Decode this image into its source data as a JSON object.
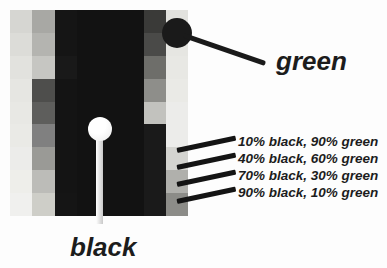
{
  "figure": {
    "name": "pixelated-green-black-gradient-diagram",
    "background_color": "#fdfdfd"
  },
  "image_block": {
    "name": "pixelated-image",
    "columns": 8,
    "rows": 9,
    "description": "Blocky pixelated grayscale image of black-to-green gradient squares",
    "grid_values": [
      [
        "#d6d6d2",
        "#a8a8a4",
        "#151515",
        "#121212",
        "#121212",
        "#121212",
        "#3a3a38",
        "#e2e2de"
      ],
      [
        "#dcdcd8",
        "#b4b4b0",
        "#151515",
        "#121212",
        "#121212",
        "#121212",
        "#4a4a48",
        "#e6e6e2"
      ],
      [
        "#e2e2de",
        "#c6c6c2",
        "#191919",
        "#121212",
        "#121212",
        "#121212",
        "#6e6e6a",
        "#e8e8e4"
      ],
      [
        "#e6e6e2",
        "#4e4e4c",
        "#141414",
        "#121212",
        "#121212",
        "#121212",
        "#8e8e8a",
        "#eaeae6"
      ],
      [
        "#e8e8e4",
        "#5e5e5c",
        "#141414",
        "#121212",
        "#121212",
        "#121212",
        "#c2c2be",
        "#ececea"
      ],
      [
        "#eaeae6",
        "#808080",
        "#141414",
        "#121212",
        "#121212",
        "#121212",
        "#1a1a1a",
        "#ececea"
      ],
      [
        "#ececea",
        "#9a9a96",
        "#141414",
        "#121212",
        "#121212",
        "#121212",
        "#1a1a1a",
        "#d4d4d0"
      ],
      [
        "#eeeeea",
        "#bcbcb8",
        "#141414",
        "#121212",
        "#121212",
        "#121212",
        "#1a1a1a",
        "#b0b0ac"
      ],
      [
        "#f0f0ee",
        "#cecec8",
        "#151515",
        "#121212",
        "#121212",
        "#121212",
        "#1a1a1a",
        "#8c8c88"
      ]
    ]
  },
  "callouts": {
    "green": {
      "label": "green",
      "marker": "filled-black-circle",
      "marker_color": "#1a1a1a"
    },
    "black": {
      "label": "black",
      "marker": "filled-white-circle",
      "marker_color": "#ffffff"
    }
  },
  "mix_labels": [
    {
      "text": "10% black, 90% green",
      "black_pct": 10,
      "green_pct": 90
    },
    {
      "text": "40% black, 60% green",
      "black_pct": 40,
      "green_pct": 60
    },
    {
      "text": "70% black, 30% green",
      "black_pct": 70,
      "green_pct": 30
    },
    {
      "text": "90% black, 10% green",
      "black_pct": 90,
      "green_pct": 10
    }
  ]
}
